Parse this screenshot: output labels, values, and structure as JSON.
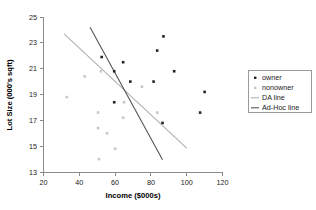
{
  "chart_data": {
    "type": "scatter",
    "title": "",
    "xlabel": "Income ($000s)",
    "ylabel": "Lot Size (000's sqft)",
    "xlim": [
      20,
      120
    ],
    "ylim": [
      13,
      25
    ],
    "xticks": [
      20,
      40,
      60,
      80,
      100,
      120
    ],
    "yticks": [
      13,
      15,
      17,
      19,
      21,
      23,
      25
    ],
    "grid": false,
    "legend_position": "right",
    "series": [
      {
        "name": "owner",
        "type": "scatter",
        "marker": "filled-square",
        "color": "#222222",
        "points": [
          [
            52.5,
            21.9
          ],
          [
            59.5,
            20.8
          ],
          [
            59.5,
            18.4
          ],
          [
            64.5,
            21.5
          ],
          [
            68.5,
            20.0
          ],
          [
            81.5,
            20.0
          ],
          [
            83.5,
            22.4
          ],
          [
            87.0,
            23.5
          ],
          [
            86.5,
            16.8
          ],
          [
            93.0,
            20.8
          ],
          [
            107.5,
            17.6
          ],
          [
            110.0,
            19.2
          ]
        ]
      },
      {
        "name": "nonowner",
        "type": "scatter",
        "marker": "filled-square",
        "color": "#c8c8c8",
        "points": [
          [
            33.0,
            18.8
          ],
          [
            43.0,
            20.4
          ],
          [
            50.5,
            17.6
          ],
          [
            50.5,
            16.4
          ],
          [
            51.0,
            14.0
          ],
          [
            52.0,
            20.8
          ],
          [
            55.5,
            16.0
          ],
          [
            60.0,
            14.8
          ],
          [
            64.5,
            17.2
          ],
          [
            65.0,
            18.4
          ],
          [
            75.0,
            19.6
          ],
          [
            83.5,
            17.6
          ]
        ]
      },
      {
        "name": "DA line",
        "type": "line",
        "color": "#b0b0b0",
        "endpoints": [
          [
            31.5,
            23.7
          ],
          [
            100.0,
            14.85
          ]
        ]
      },
      {
        "name": "Ad-Hoc line",
        "type": "line",
        "color": "#555555",
        "endpoints": [
          [
            46.0,
            24.2
          ],
          [
            86.5,
            13.95
          ]
        ]
      }
    ],
    "legend_entries": [
      {
        "label": "owner",
        "kind": "marker",
        "color": "#222222"
      },
      {
        "label": "nonowner",
        "kind": "marker",
        "color": "#c8c8c8"
      },
      {
        "label": "DA line",
        "kind": "line",
        "color": "#b0b0b0"
      },
      {
        "label": "Ad-Hoc line",
        "kind": "line",
        "color": "#555555"
      }
    ]
  },
  "axes": {
    "x_title": "Income ($000s)",
    "y_title": "Lot Size (000's sqft)",
    "x_tick_labels": [
      "20",
      "40",
      "60",
      "80",
      "100",
      "120"
    ],
    "y_tick_labels": [
      "13",
      "15",
      "17",
      "19",
      "21",
      "23",
      "25"
    ]
  },
  "legend": {
    "items": [
      {
        "label": "owner"
      },
      {
        "label": "nonowner"
      },
      {
        "label": "DA line"
      },
      {
        "label": "Ad-Hoc line"
      }
    ]
  }
}
